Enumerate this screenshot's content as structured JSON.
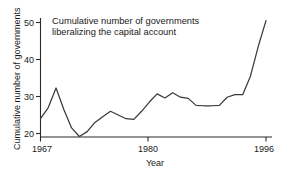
{
  "chart_data": {
    "type": "line",
    "title": "Cumulative number of governments\nliberalizing the capital account",
    "xlabel": "Year",
    "ylabel": "Cumulative number of governments",
    "xlim": [
      1967,
      1996
    ],
    "ylim": [
      19,
      51
    ],
    "xticks": [
      1967,
      1980,
      1996
    ],
    "xtick_labels": [
      "1967",
      "1980",
      "1996"
    ],
    "yticks": [
      20,
      30,
      40,
      50
    ],
    "ytick_labels": [
      "20",
      "30",
      "40",
      "50"
    ],
    "grid": false,
    "legend": "none",
    "line_color": "#3a3a3a",
    "axis_color": "#2b2b2b",
    "background": "#ffffff",
    "x": [
      1967,
      1968,
      1969,
      1970,
      1971,
      1972,
      1973,
      1974,
      1975,
      1976,
      1977,
      1978,
      1979,
      1980,
      1981,
      1982,
      1983,
      1984,
      1985,
      1986,
      1987,
      1988,
      1989,
      1990,
      1991,
      1992,
      1993,
      1994,
      1995,
      1996
    ],
    "values": [
      24.0,
      27.0,
      32.3,
      26.5,
      21.5,
      19.2,
      20.5,
      23.0,
      24.5,
      26.0,
      25.0,
      24.0,
      23.8,
      26.0,
      28.5,
      30.7,
      29.6,
      31.0,
      29.8,
      29.5,
      27.6,
      27.5,
      27.5,
      27.6,
      29.8,
      30.5,
      30.5,
      35.5,
      43.5,
      50.5
    ],
    "series": [
      {
        "name": "Cumulative number of governments liberalizing the capital account",
        "values": [
          24.0,
          27.0,
          32.3,
          26.5,
          21.5,
          19.2,
          20.5,
          23.0,
          24.5,
          26.0,
          25.0,
          24.0,
          23.8,
          26.0,
          28.5,
          30.7,
          29.6,
          31.0,
          29.8,
          29.5,
          27.6,
          27.5,
          27.5,
          27.6,
          29.8,
          30.5,
          30.5,
          35.5,
          43.5,
          50.5
        ]
      }
    ]
  },
  "titles": {
    "chart_title": "Cumulative number of governments\nliberalizing the capital account",
    "x_axis_title": "Year",
    "y_axis_title": "Cumulative number of governments"
  }
}
